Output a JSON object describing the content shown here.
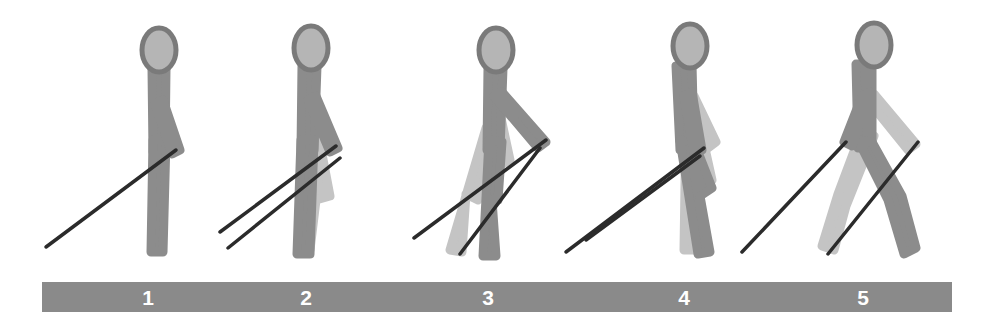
{
  "figure": {
    "canvas": {
      "width": 990,
      "height": 328,
      "background": "#ffffff"
    },
    "colors": {
      "near_limb": "#8c8c8c",
      "far_limb": "#c4c4c4",
      "head_outline": "#7a7a7a",
      "head_fill": "#b5b5b5",
      "cane": "#2b2b2b",
      "ground_bar": "#8a8a8a",
      "number_text": "#ffffff"
    },
    "ground_bar": {
      "name": "ground-bar",
      "x": 42,
      "y": 282,
      "width": 910,
      "height": 30,
      "color": "#8a8a8a"
    },
    "step_labels": [
      {
        "label": "1",
        "x": 148,
        "y": 298
      },
      {
        "label": "2",
        "x": 306,
        "y": 298
      },
      {
        "label": "3",
        "x": 488,
        "y": 298
      },
      {
        "label": "4",
        "x": 684,
        "y": 298
      },
      {
        "label": "5",
        "x": 863,
        "y": 298
      }
    ],
    "figures": [
      {
        "name": "gait-figure-1",
        "step": "1",
        "description": "Standing upright, cane tip forward-left touching ground, both legs together",
        "head": {
          "cx": 159,
          "cy": 50,
          "rx": 17,
          "ry": 22
        },
        "body": [
          {
            "part": "torso",
            "shade": "near",
            "points": "152,68 166,68 165,152 153,152"
          },
          {
            "part": "near-leg",
            "shade": "near",
            "points": "153,140 166,140 163,252 151,252"
          },
          {
            "part": "near-arm",
            "shade": "near",
            "points": "155,104 163,100 180,150 172,154"
          }
        ],
        "cane": {
          "x1": 176,
          "y1": 150,
          "x2": 46,
          "y2": 247
        }
      },
      {
        "name": "gait-figure-2",
        "step": "2",
        "description": "Weight shift, trailing leg extends back, cane swinging forward",
        "head": {
          "cx": 311,
          "cy": 48,
          "rx": 17,
          "ry": 22
        },
        "body": [
          {
            "part": "far-leg",
            "shade": "far",
            "points": "305,128 318,133 330,196 316,200 310,250 298,248"
          },
          {
            "part": "far-arm",
            "shade": "far",
            "points": "305,104 313,101 322,150 313,153"
          },
          {
            "part": "torso",
            "shade": "near",
            "points": "302,66 317,66 314,150 301,150"
          },
          {
            "part": "near-leg",
            "shade": "near",
            "points": "301,140 314,140 310,254 297,254"
          },
          {
            "part": "near-arm",
            "shade": "near",
            "points": "308,100 316,96 338,148 330,152"
          }
        ],
        "cane": {
          "x1": 336,
          "y1": 146,
          "x2": 220,
          "y2": 232
        },
        "cane2": {
          "x1": 340,
          "y1": 158,
          "x2": 228,
          "y2": 248
        }
      },
      {
        "name": "gait-figure-3",
        "step": "3",
        "description": "Mid-stride, legs open, cane extended forward-right, arm reaching",
        "head": {
          "cx": 496,
          "cy": 50,
          "rx": 17,
          "ry": 22
        },
        "body": [
          {
            "part": "far-leg",
            "shade": "far",
            "points": "486,128 498,133 478,200 466,194 462,252 450,250"
          },
          {
            "part": "far-arm",
            "shade": "far",
            "points": "490,108 498,104 510,160 502,164"
          },
          {
            "part": "torso",
            "shade": "near",
            "points": "488,68 503,68 500,150 487,150"
          },
          {
            "part": "near-leg",
            "shade": "near",
            "points": "489,140 502,142 498,200 492,200 496,256 483,256"
          },
          {
            "part": "near-arm",
            "shade": "near",
            "points": "494,96 502,92 546,142 538,148"
          }
        ],
        "cane": {
          "x1": 546,
          "y1": 140,
          "x2": 414,
          "y2": 238
        },
        "cane2": {
          "x1": 540,
          "y1": 148,
          "x2": 460,
          "y2": 254
        }
      },
      {
        "name": "gait-figure-4",
        "step": "4",
        "description": "Leaning forward, knee bent, cane pair angled down-left",
        "head": {
          "cx": 690,
          "cy": 46,
          "rx": 17,
          "ry": 22
        },
        "body": [
          {
            "part": "far-leg",
            "shade": "far",
            "points": "686,120 700,126 712,180 700,186 696,250 684,250"
          },
          {
            "part": "far-arm",
            "shade": "far",
            "points": "686,100 694,96 716,142 708,148"
          },
          {
            "part": "torso",
            "shade": "near",
            "points": "676,66 692,64 694,148 680,150"
          },
          {
            "part": "near-leg",
            "shade": "near",
            "points": "680,140 694,142 712,188 700,196 710,252 698,254"
          },
          {
            "part": "near-arm",
            "shade": "near",
            "points": "684,96 692,92 702,150 694,154"
          }
        ],
        "cane": {
          "x1": 704,
          "y1": 148,
          "x2": 566,
          "y2": 252
        },
        "cane2": {
          "x1": 700,
          "y1": 156,
          "x2": 586,
          "y2": 240
        }
      },
      {
        "name": "gait-figure-5",
        "step": "5",
        "description": "Legs crossed scissor position, cane crossing behind, arm forward",
        "head": {
          "cx": 874,
          "cy": 45,
          "rx": 17,
          "ry": 22
        },
        "body": [
          {
            "part": "far-leg",
            "shade": "far",
            "points": "862,130 874,136 846,206 834,250 822,246 838,194"
          },
          {
            "part": "far-arm",
            "shade": "far",
            "points": "866,98 874,94 916,144 908,150"
          },
          {
            "part": "torso",
            "shade": "near",
            "points": "856,64 872,64 872,148 858,148"
          },
          {
            "part": "near-leg",
            "shade": "near",
            "points": "858,140 872,142 902,196 916,248 904,254 888,200"
          },
          {
            "part": "near-arm",
            "shade": "near",
            "points": "862,96 870,92 852,146 844,142"
          }
        ],
        "cane": {
          "x1": 846,
          "y1": 142,
          "x2": 742,
          "y2": 252
        },
        "cane2": {
          "x1": 918,
          "y1": 142,
          "x2": 828,
          "y2": 254
        }
      }
    ]
  }
}
